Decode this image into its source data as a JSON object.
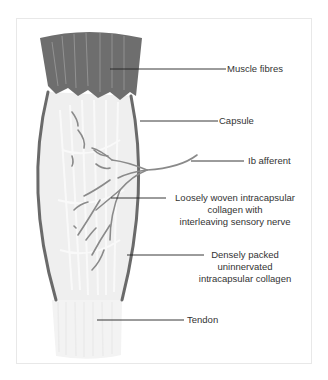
{
  "diagram": {
    "colors": {
      "muscle": "#6e6e6e",
      "capsule": "#6a6a6a",
      "nerve": "#8a8a8a",
      "collagen": "#efefef",
      "tendon": "#f2f2f2",
      "leader": "#222222",
      "text": "#333333",
      "frame": "#e8e8e8"
    },
    "labels": [
      {
        "id": "muscle-fibres",
        "lines": [
          "Muscle fibres"
        ]
      },
      {
        "id": "capsule",
        "lines": [
          "Capsule"
        ]
      },
      {
        "id": "ib-afferent",
        "lines": [
          "Ib afferent"
        ]
      },
      {
        "id": "loose-collagen",
        "lines": [
          "Loosely woven intracapsular",
          "collagen with",
          "interleaving sensory nerve"
        ]
      },
      {
        "id": "dense-collagen",
        "lines": [
          "Densely packed",
          "uninnervated",
          "intracapsular collagen"
        ]
      },
      {
        "id": "tendon",
        "lines": [
          "Tendon"
        ]
      }
    ]
  }
}
